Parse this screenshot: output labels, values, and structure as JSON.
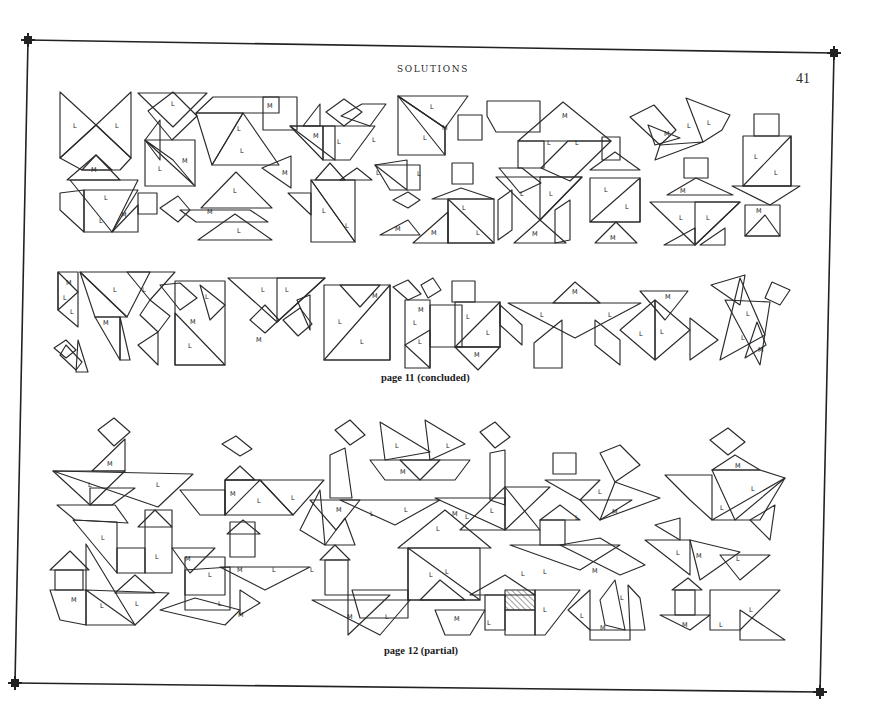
{
  "page": {
    "running_head": "SOLUTIONS",
    "page_number": "41"
  },
  "sections": [
    {
      "caption": "page 11 (concluded)"
    },
    {
      "caption": "page 12 (partial)"
    }
  ],
  "piece_labels": {
    "large_triangle": "L",
    "medium_triangle": "M"
  },
  "colors": {
    "ink": "#2b2b2b",
    "paper": "#ffffff"
  }
}
